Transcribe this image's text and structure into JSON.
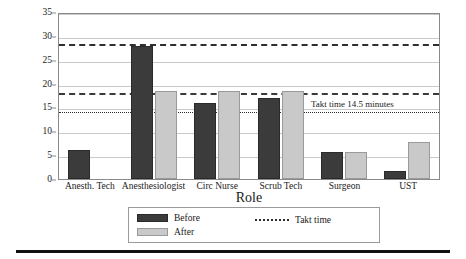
{
  "chart_data": {
    "type": "bar",
    "title": "",
    "xlabel": "Role",
    "ylabel": "Cycle Time (minutes)",
    "ylim": [
      0,
      35
    ],
    "ytick_step": 5,
    "yticks": [
      0,
      5,
      10,
      15,
      20,
      25,
      30,
      35
    ],
    "grid": true,
    "legend_position": "bottom",
    "categories": [
      "Anesth. Tech",
      "Anesthesiologist",
      "Circ Nurse",
      "Scrub Tech",
      "Surgeon",
      "UST"
    ],
    "series": [
      {
        "name": "Before",
        "color": "#3b3b3b",
        "values": [
          6.0,
          27.8,
          16.0,
          16.9,
          5.7,
          1.7
        ]
      },
      {
        "name": "After",
        "color": "#c9c9c9",
        "values": [
          0,
          18.5,
          18.4,
          18.4,
          5.7,
          7.7
        ]
      }
    ],
    "reference_lines": [
      {
        "name": "upper-dashed-line",
        "value": 28.8,
        "style": "dashed"
      },
      {
        "name": "mid-dashdot-line",
        "value": 18.4,
        "style": "dashdot"
      },
      {
        "name": "takt-time-line",
        "value": 14.5,
        "style": "dotted",
        "label": "Takt time 14.5 minutes"
      }
    ],
    "legend_entries": [
      {
        "name": "Before",
        "marker": "dark-square"
      },
      {
        "name": "After",
        "marker": "light-square"
      },
      {
        "name": "Takt time",
        "marker": "dotted-line"
      }
    ],
    "annotations": [
      {
        "text": "Takt time 14.5 minutes",
        "value": 14.5
      }
    ]
  }
}
